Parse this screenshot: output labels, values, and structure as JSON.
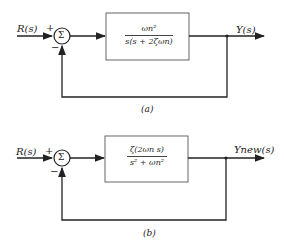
{
  "diagrams": [
    {
      "caption": "(a)",
      "input_label": "R(s)",
      "output_label": "Y(s)",
      "summer_symbol": "Σ",
      "plus_sign": "+",
      "minus_sign": "−",
      "block": {
        "numerator": "ωn²",
        "denominator": "s(s + 2ζωn)"
      }
    },
    {
      "caption": "(b)",
      "input_label": "R(s)",
      "output_label": "Ynew(s)",
      "summer_symbol": "Σ",
      "plus_sign": "+",
      "minus_sign": "−",
      "block": {
        "numerator": "ζ(2ωn s)",
        "denominator": "s² + ωn²"
      }
    }
  ],
  "colors": {
    "line": "#222222",
    "block_border": "#555555"
  }
}
